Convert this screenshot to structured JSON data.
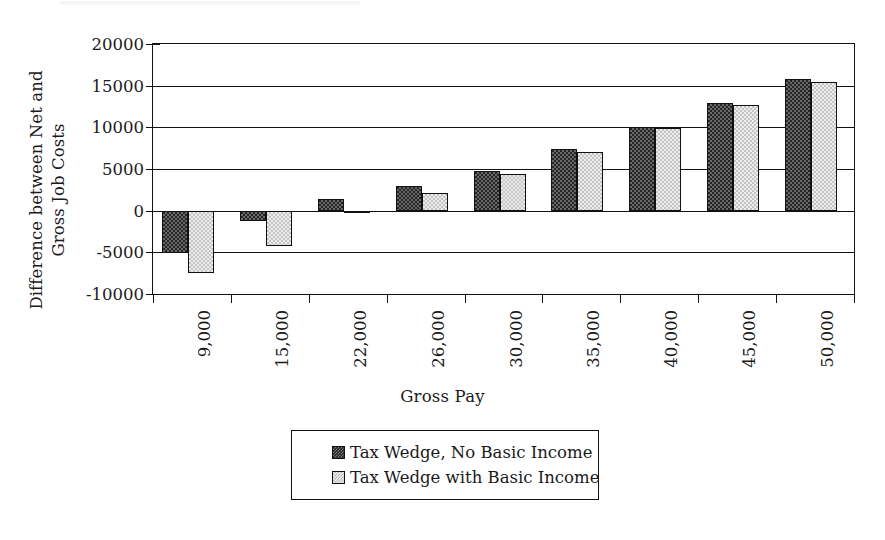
{
  "chart_data": {
    "type": "bar",
    "title": "",
    "xlabel": "Gross Pay",
    "ylabel": "Difference between Net and\nGross Job Costs",
    "categories": [
      "9,000",
      "15,000",
      "22,000",
      "26,000",
      "30,000",
      "35,000",
      "40,000",
      "45,000",
      "50,000"
    ],
    "series": [
      {
        "name": "Tax Wedge, No Basic Income",
        "color": "#262626",
        "pattern": "dark-checker",
        "values": [
          -5100,
          -1300,
          1400,
          2950,
          4750,
          7400,
          10100,
          12950,
          15800
        ]
      },
      {
        "name": "Tax Wedge with Basic Income",
        "color": "#ececec",
        "pattern": "light-checker",
        "values": [
          -7500,
          -4200,
          -50,
          2100,
          4350,
          7050,
          9950,
          12700,
          15500
        ]
      }
    ],
    "yticks": [
      20000,
      15000,
      10000,
      5000,
      0,
      -5000,
      -10000
    ],
    "ytick_labels": [
      "20000",
      "15000",
      "10000",
      "5000",
      "0",
      "-5000",
      "-10000"
    ],
    "ylim": [
      -10000,
      20000
    ],
    "grid": true,
    "legend_position": "bottom-center",
    "legend_entries": [
      "Tax Wedge, No Basic Income",
      "Tax Wedge with Basic Income"
    ]
  },
  "axis": {
    "y_title_line1": "Difference between Net and",
    "y_title_line2": "Gross Job Costs",
    "x_title": "Gross Pay"
  }
}
